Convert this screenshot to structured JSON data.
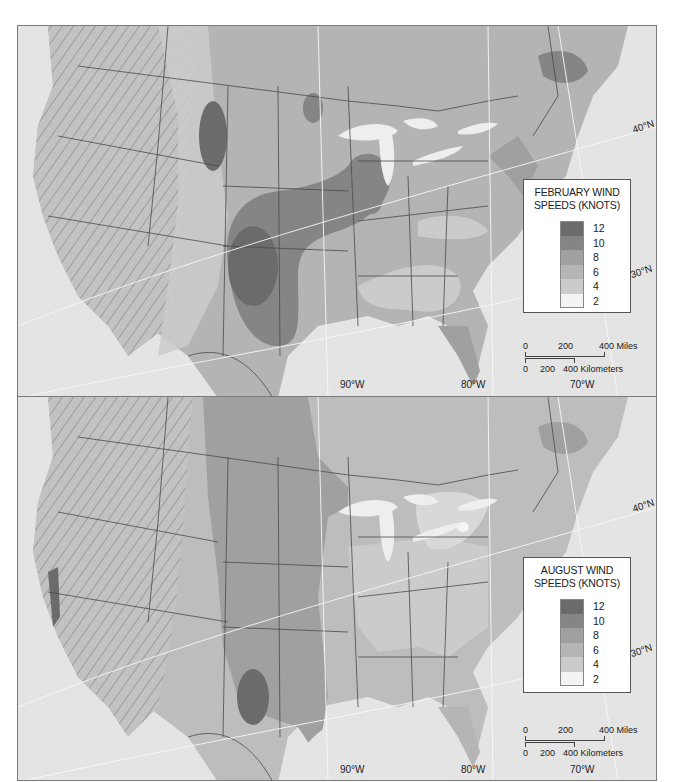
{
  "maps": [
    {
      "id": "february",
      "legend": {
        "title_line1": "FEBRUARY WIND",
        "title_line2": "SPEEDS (KNOTS)",
        "classes": [
          {
            "value": "12",
            "color": "#6b6b6b"
          },
          {
            "value": "10",
            "color": "#858585"
          },
          {
            "value": "8",
            "color": "#a0a0a0"
          },
          {
            "value": "6",
            "color": "#b5b5b5"
          },
          {
            "value": "4",
            "color": "#cbcbcb"
          },
          {
            "value": "2",
            "color": "#f3f3f3"
          }
        ]
      },
      "longitude_labels": [
        "90°W",
        "80°W",
        "70°W"
      ],
      "latitude_labels": [
        "40°N",
        "30°N"
      ],
      "scale_bar": {
        "miles": {
          "ticks": [
            "0",
            "200",
            "400 Miles"
          ]
        },
        "kilometers": {
          "ticks": [
            "0",
            "200",
            "400 Kilometers"
          ]
        }
      }
    },
    {
      "id": "august",
      "legend": {
        "title_line1": "AUGUST WIND",
        "title_line2": "SPEEDS (KNOTS)",
        "classes": [
          {
            "value": "12",
            "color": "#6b6b6b"
          },
          {
            "value": "10",
            "color": "#858585"
          },
          {
            "value": "8",
            "color": "#a0a0a0"
          },
          {
            "value": "6",
            "color": "#b5b5b5"
          },
          {
            "value": "4",
            "color": "#cbcbcb"
          },
          {
            "value": "2",
            "color": "#f3f3f3"
          }
        ]
      },
      "longitude_labels": [
        "90°W",
        "80°W",
        "70°W"
      ],
      "latitude_labels": [
        "40°N",
        "30°N"
      ],
      "scale_bar": {
        "miles": {
          "ticks": [
            "0",
            "200",
            "400 Miles"
          ]
        },
        "kilometers": {
          "ticks": [
            "0",
            "200",
            "400 Kilometers"
          ]
        }
      }
    }
  ],
  "colors": {
    "ocean": "#e4e4e4",
    "terrain": "#c4c4c4",
    "terrain_dark": "#a9a9a9",
    "borders": "#4a4a4a",
    "lakes": "#eeeeee",
    "graticule": "#f8f8f8"
  }
}
